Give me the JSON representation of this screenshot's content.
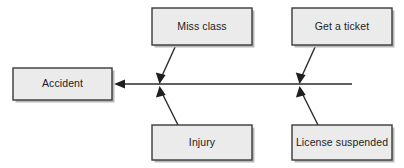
{
  "diagram": {
    "type": "fishbone-cause-and-effect",
    "title": "",
    "background_color": "#ffffff",
    "box_fill_color": "#ebebeb",
    "box_border_color": "#3a3a3a",
    "line_color": "#2b2b2b",
    "text_color": "#1c1c1c",
    "effect": {
      "label": "Accident",
      "x": 13,
      "y": 68,
      "width": 99,
      "height": 32
    },
    "spine": {
      "from_x": 352,
      "to_x": 114,
      "y": 84,
      "arrow_direction": "left"
    },
    "causes": [
      {
        "id": "miss-class",
        "label": "Miss class",
        "position": "top-left",
        "x": 152,
        "y": 8,
        "width": 100,
        "height": 37,
        "branch": {
          "start_x": 176,
          "start_y": 45,
          "end_x": 160,
          "end_y": 82
        }
      },
      {
        "id": "get-a-ticket",
        "label": "Get a ticket",
        "position": "top-right",
        "x": 292,
        "y": 8,
        "width": 100,
        "height": 37,
        "branch": {
          "start_x": 316,
          "start_y": 45,
          "end_x": 300,
          "end_y": 82
        }
      },
      {
        "id": "injury",
        "label": "Injury",
        "position": "bottom-left",
        "x": 152,
        "y": 125,
        "width": 100,
        "height": 35,
        "branch": {
          "start_x": 178,
          "start_y": 125,
          "end_x": 160,
          "end_y": 88
        }
      },
      {
        "id": "license-suspended",
        "label": "License suspended",
        "position": "bottom-right",
        "x": 292,
        "y": 125,
        "width": 100,
        "height": 35,
        "branch": {
          "start_x": 318,
          "start_y": 125,
          "end_x": 300,
          "end_y": 88
        }
      }
    ]
  }
}
